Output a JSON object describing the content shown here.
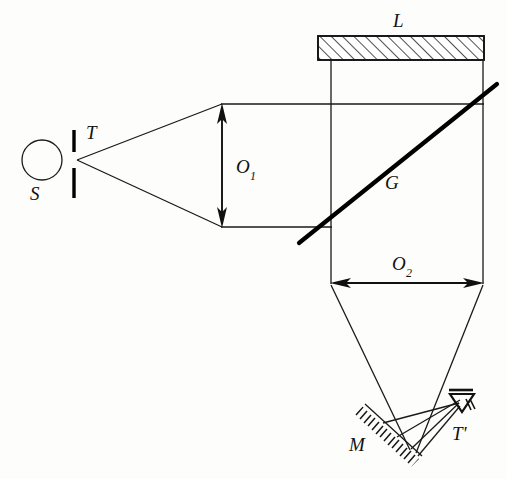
{
  "figure": {
    "background_color": "#fdfdfb",
    "ink_color": "#111111",
    "width": 507,
    "height": 479
  },
  "labels": {
    "source": "S",
    "slit": "T",
    "lens": "L",
    "beam_splitter": "G",
    "aperture_1_base": "O",
    "aperture_1_sub": "1",
    "aperture_2_base": "O",
    "aperture_2_sub": "2",
    "mirror": "M",
    "image_slit": "T'"
  },
  "components": [
    {
      "name": "source",
      "label": "S",
      "type": "circle",
      "cx": 42,
      "cy": 160,
      "r": 20
    },
    {
      "name": "slit",
      "label": "T",
      "type": "double-bar",
      "x": 74,
      "upper_y1": 130,
      "upper_y2": 152,
      "lower_y1": 168,
      "lower_y2": 198,
      "gap_center_y": 160
    },
    {
      "name": "lens",
      "label": "L",
      "type": "hatched-rect",
      "x": 318,
      "y": 36,
      "width": 166,
      "height": 24,
      "hatch_direction": "up-right"
    },
    {
      "name": "beam-splitter",
      "label": "G",
      "type": "thick-line",
      "x1": 299,
      "y1": 243,
      "x2": 497,
      "y2": 84,
      "angle_deg": 38.7
    },
    {
      "name": "aperture-1",
      "label": "O1",
      "type": "double-arrow-vertical",
      "x": 222,
      "y1": 104,
      "y2": 227,
      "label_x": 240,
      "label_y": 172
    },
    {
      "name": "aperture-2",
      "label": "O2",
      "type": "double-arrow-horizontal",
      "y": 283,
      "x1": 331,
      "x2": 483,
      "label_x": 398,
      "label_y": 270
    },
    {
      "name": "mirror",
      "label": "M",
      "type": "hatched-line",
      "x1": 365,
      "y1": 404,
      "x2": 422,
      "y2": 456,
      "hatch_side": "below-left"
    },
    {
      "name": "observer-eye",
      "label": "T'",
      "type": "eye-symbol",
      "x": 463,
      "y": 398,
      "label_x": 464,
      "label_y": 432
    }
  ],
  "rays": {
    "divergent_from_slit": [
      {
        "x1": 76,
        "y1": 160,
        "x2": 222,
        "y2": 104
      },
      {
        "x1": 76,
        "y1": 160,
        "x2": 222,
        "y2": 227
      }
    ],
    "collimated_beam": [
      {
        "x1": 222,
        "y1": 104,
        "x2": 483,
        "y2": 104
      },
      {
        "x1": 222,
        "y1": 227,
        "x2": 331,
        "y2": 227
      }
    ],
    "vertical_beam_edges": [
      {
        "x1": 331,
        "y1": 60,
        "x2": 331,
        "y2": 283
      },
      {
        "x1": 483,
        "y1": 60,
        "x2": 483,
        "y2": 283
      }
    ],
    "converging_to_mirror": [
      {
        "x1": 331,
        "y1": 285,
        "x2": 409,
        "y2": 449
      },
      {
        "x1": 483,
        "y1": 285,
        "x2": 414,
        "y2": 451
      }
    ],
    "reflected_to_eye": [
      {
        "x1": 385,
        "y1": 424,
        "x2": 460,
        "y2": 404
      },
      {
        "x1": 412,
        "y1": 450,
        "x2": 460,
        "y2": 404
      },
      {
        "x1": 418,
        "y1": 455,
        "x2": 460,
        "y2": 407
      },
      {
        "x1": 396,
        "y1": 437,
        "x2": 461,
        "y2": 401
      }
    ]
  }
}
